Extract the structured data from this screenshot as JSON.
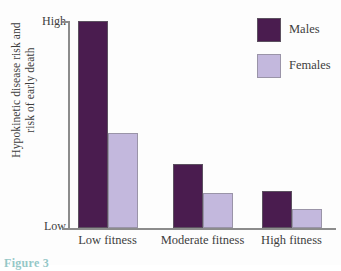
{
  "chart_data": {
    "type": "bar",
    "title": "",
    "xlabel": "",
    "ylabel_line1": "Hypokinetic disease risk and",
    "ylabel_line2": "risk of early death",
    "categories": [
      "Low fitness",
      "Moderate fitness",
      "High fitness"
    ],
    "series": [
      {
        "name": "Males",
        "color": "#4a1c4f",
        "values": [
          100,
          31,
          18
        ]
      },
      {
        "name": "Females",
        "color": "#c3b8dd",
        "values": [
          46,
          17,
          9
        ]
      }
    ],
    "ylim": [
      0,
      100
    ],
    "ytick_labels": [
      "High",
      "Low"
    ],
    "ytick_high": "High",
    "ytick_low": "Low",
    "grid": false,
    "legend_position": "top-right",
    "value_unit": "relative risk (unitless scale, Low to High)"
  },
  "legend": {
    "items": [
      {
        "label": "Males"
      },
      {
        "label": "Females"
      }
    ]
  },
  "caption": {
    "fragment": "Figure 3"
  }
}
